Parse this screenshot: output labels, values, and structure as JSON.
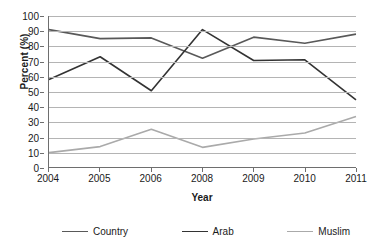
{
  "chart_data": {
    "type": "line",
    "title": "",
    "xlabel": "Year",
    "ylabel": "Percent (%)",
    "categories": [
      "2004",
      "2005",
      "2006",
      "2008",
      "2009",
      "2010",
      "2011"
    ],
    "ylim": [
      0,
      100
    ],
    "ytick_step": 10,
    "yticks": [
      "100",
      "90",
      "80",
      "70",
      "60",
      "50",
      "40",
      "30",
      "20",
      "10",
      "0"
    ],
    "grid": true,
    "legend_position": "bottom",
    "series": [
      {
        "name": "Country",
        "color": "#595959",
        "values": [
          91,
          85,
          85.5,
          72,
          86,
          82,
          88
        ]
      },
      {
        "name": "Arab",
        "color": "#333333",
        "values": [
          58,
          73,
          50.5,
          91,
          70.5,
          71,
          44.5
        ]
      },
      {
        "name": "Muslim",
        "color": "#aaaaaa",
        "values": [
          9.5,
          13.5,
          25,
          13,
          18.5,
          22.5,
          33.5
        ]
      }
    ]
  },
  "legend": {
    "items": [
      {
        "label": "Country"
      },
      {
        "label": "Arab"
      },
      {
        "label": "Muslim"
      }
    ]
  }
}
